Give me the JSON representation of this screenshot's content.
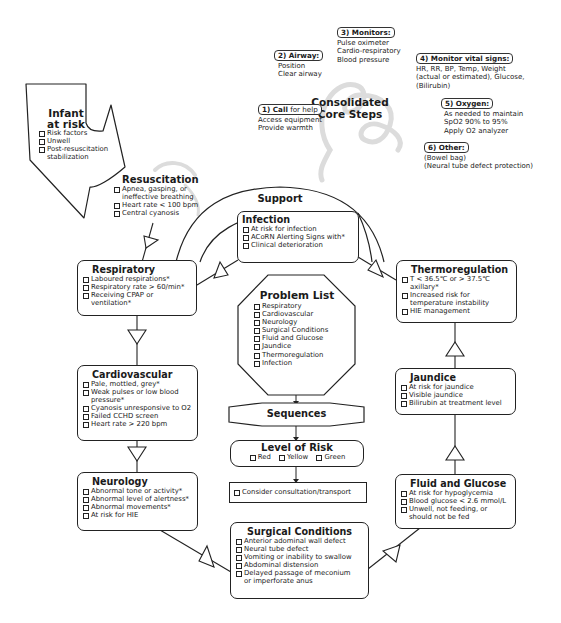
{
  "core_steps": {
    "title_line1": "Consolidated",
    "title_line2": "Core Steps",
    "steps": [
      {
        "label_bold": "1) Call",
        "label_rest": " for help",
        "lines": [
          "Access equipment",
          "Provide warmth"
        ]
      },
      {
        "label_bold": "2) Airway:",
        "label_rest": "",
        "lines": [
          "Position",
          "Clear airway"
        ]
      },
      {
        "label_bold": "3) Monitors:",
        "label_rest": "",
        "lines": [
          "Pulse oximeter",
          "Cardio-respiratory",
          "Blood pressure"
        ]
      },
      {
        "label_bold": "4) Monitor vital signs:",
        "label_rest": "",
        "lines": [
          "HR, RR, BP, Temp, Weight",
          "(actual or estimated), Glucose,",
          "(Bilirubin)"
        ]
      },
      {
        "label_bold": "5) Oxygen:",
        "label_rest": "",
        "lines": [
          "As needed to maintain",
          "SpO2 90% to 95%",
          "Apply O2 analyzer"
        ]
      },
      {
        "label_bold": "6) Other:",
        "label_rest": "",
        "lines": [
          "(Bowel bag)",
          "(Neural tube defect protection)"
        ]
      }
    ]
  },
  "infant_at_risk": {
    "title_line1": "Infant",
    "title_line2": "at risk",
    "items": [
      "Risk factors",
      "Unwell",
      "Post-resuscitation stabilization"
    ]
  },
  "resuscitation": {
    "title": "Resuscitation",
    "items": [
      "Apnea, gasping, or ineffective breathing",
      "Heart rate < 100 bpm",
      "Central cyanosis"
    ]
  },
  "support": {
    "label": "Support"
  },
  "infection": {
    "title": "Infection",
    "items": [
      "At risk for infection",
      "ACoRN Alerting Signs with*",
      "Clinical deterioration"
    ]
  },
  "respiratory": {
    "title": "Respiratory",
    "items": [
      "Laboured respirations*",
      "Respiratory rate > 60/min*",
      "Receiving CPAP or ventilation*"
    ]
  },
  "thermoregulation": {
    "title": "Thermoregulation",
    "items": [
      "T < 36.5℃ or > 37.5℃ axillary*",
      "Increased risk for temperature instability",
      "HIE management"
    ]
  },
  "problem_list": {
    "title": "Problem List",
    "items": [
      "Respiratory",
      "Cardiovascular",
      "Neurology",
      "Surgical Conditions",
      "Fluid and Glucose",
      "Jaundice",
      "Thermoregulation",
      "Infection"
    ]
  },
  "sequences": {
    "label": "Sequences"
  },
  "level_of_risk": {
    "title": "Level of Risk",
    "options": [
      "Red",
      "Yellow",
      "Green"
    ]
  },
  "consult": {
    "items": [
      "Consider consultation/transport"
    ]
  },
  "cardiovascular": {
    "title": "Cardiovascular",
    "items": [
      "Pale, mottled, grey*",
      "Weak pulses or low blood pressure*",
      "Cyanosis unresponsive to O2",
      "Failed CCHD screen",
      "Heart rate > 220 bpm"
    ]
  },
  "jaundice": {
    "title": "Jaundice",
    "items": [
      "At risk for jaundice",
      "Visible jaundice",
      "Bilirubin at treatment level"
    ]
  },
  "neurology": {
    "title": "Neurology",
    "items": [
      "Abnormal tone or activity*",
      "Abnormal level of alertness*",
      "Abnormal movements*",
      "At risk for HIE"
    ]
  },
  "fluid_glucose": {
    "title": "Fluid and Glucose",
    "items": [
      "At risk for hypoglycemia",
      "Blood glucose < 2.6 mmol/L",
      "Unwell, not feeding, or should not be fed"
    ]
  },
  "surgical": {
    "title": "Surgical Conditions",
    "items": [
      "Anterior adominal wall defect",
      "Neural tube defect",
      "Vomiting or inability to swallow",
      "Abdominal distension",
      "Delayed passage of meconium or imperforate anus"
    ]
  },
  "colors": {
    "line": "#222222",
    "watermark": "#d8d8d8"
  }
}
